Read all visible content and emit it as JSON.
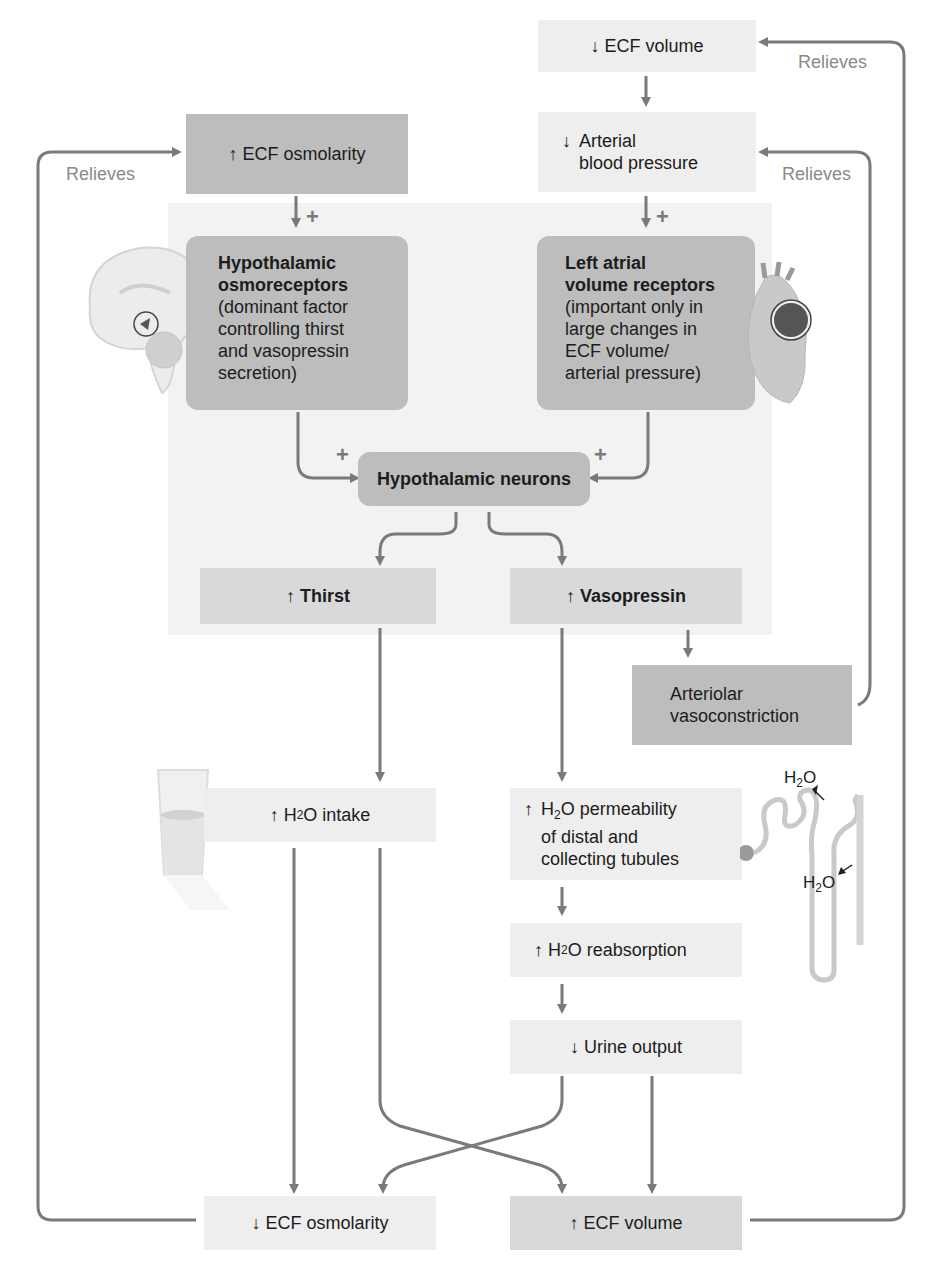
{
  "diagram": {
    "type": "flowchart",
    "topic": "Control of thirst and vasopressin secretion by ECF osmolarity and ECF volume",
    "colors": {
      "arrow": "#7a7a7a",
      "box_light": "#eeeeee",
      "box_mid": "#d9d9d9",
      "box_dark": "#bdbdbd",
      "panel": "#f2f2f2",
      "label": "#8a8a8a"
    },
    "nodes": {
      "ecf_volume_down": {
        "arrow": "↓",
        "text": "ECF volume"
      },
      "arterial_bp_down": {
        "arrow": "↓",
        "line1": "Arterial",
        "line2": "blood pressure"
      },
      "ecf_osmolarity_up": {
        "arrow": "↑",
        "text": "ECF osmolarity"
      },
      "osmoreceptors": {
        "title1": "Hypothalamic",
        "title2": "osmoreceptors",
        "desc": [
          "(dominant factor",
          "controlling thirst",
          "and vasopressin",
          "secretion)"
        ]
      },
      "atrial_receptors": {
        "title1": "Left atrial",
        "title2": "volume receptors",
        "desc": [
          "(important only in",
          "large changes in",
          "ECF volume/",
          "arterial pressure)"
        ]
      },
      "hypothalamic_neurons": {
        "text": "Hypothalamic neurons"
      },
      "thirst": {
        "arrow": "↑",
        "text": "Thirst"
      },
      "vasopressin": {
        "arrow": "↑",
        "text": "Vasopressin"
      },
      "vasoconstriction": {
        "line1": "Arteriolar",
        "line2": "vasoconstriction"
      },
      "h2o_intake": {
        "arrow": "↑",
        "h": "H",
        "sub": "2",
        "rest": "O intake"
      },
      "h2o_permeability": {
        "arrow": "↑",
        "h": "H",
        "sub": "2",
        "rest": "O permeability",
        "line2": "of distal and",
        "line3": "collecting tubules"
      },
      "h2o_reabsorption": {
        "arrow": "↑",
        "h": "H",
        "sub": "2",
        "rest": "O reabsorption"
      },
      "urine_output": {
        "arrow": "↓",
        "text": "Urine output"
      },
      "ecf_osmolarity_down": {
        "arrow": "↓",
        "text": "ECF osmolarity"
      },
      "ecf_volume_up": {
        "arrow": "↑",
        "text": "ECF volume"
      }
    },
    "labels": {
      "relieves_top": "Relieves",
      "relieves_mid": "Relieves",
      "relieves_left": "Relieves",
      "plus": "+",
      "h2o_out_h": "H",
      "h2o_out_sub": "2",
      "h2o_out_o": "O",
      "h2o_in_h": "H",
      "h2o_in_sub": "2",
      "h2o_in_o": "O"
    },
    "illustrations": [
      "brain-sagittal",
      "heart",
      "water-glass",
      "nephron"
    ]
  }
}
